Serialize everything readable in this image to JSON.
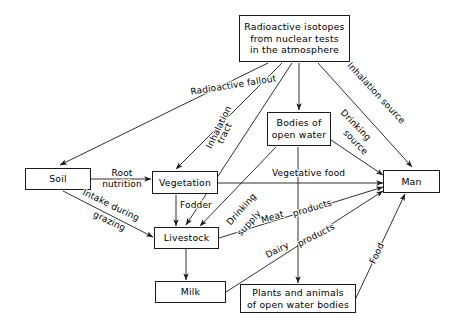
{
  "diagram": {
    "background": "#ffffff",
    "line_color": "#1a1a1a",
    "nodes": [
      {
        "id": "source",
        "label": "Radioactive isotopes\nfrom nuclear tests\nin the atmosphere"
      },
      {
        "id": "water",
        "label": "Bodies  of\nopen water"
      },
      {
        "id": "soil",
        "label": "Soil"
      },
      {
        "id": "vegetation",
        "label": "Vegetation"
      },
      {
        "id": "man",
        "label": "Man"
      },
      {
        "id": "livestock",
        "label": "Livestock"
      },
      {
        "id": "milk",
        "label": "Milk"
      },
      {
        "id": "plants",
        "label": "Plants  and  animals\nof  open  water  bodies"
      }
    ],
    "edge_labels": [
      {
        "id": "fallout",
        "text": "Radioactive  fallout"
      },
      {
        "id": "inhalation-source",
        "text": "Inhalation  source"
      },
      {
        "id": "inhalation-tract",
        "text": "Inhalation"
      },
      {
        "id": "tract",
        "text": "tract"
      },
      {
        "id": "drinking-source",
        "text": "Drinking"
      },
      {
        "id": "drinking-source-2",
        "text": "source"
      },
      {
        "id": "root-nutrition",
        "text": "Root\nnutrition"
      },
      {
        "id": "vegetative-food",
        "text": "Vegetative  food"
      },
      {
        "id": "fodder",
        "text": "Fodder"
      },
      {
        "id": "intake-grazing",
        "text": "Intake  during"
      },
      {
        "id": "intake-grazing-2",
        "text": "grazing"
      },
      {
        "id": "drinking-supply",
        "text": "Drinking"
      },
      {
        "id": "drinking-supply-2",
        "text": "supply"
      },
      {
        "id": "meat-products",
        "text": "Meat"
      },
      {
        "id": "meat-products-2",
        "text": "products"
      },
      {
        "id": "dairy-products",
        "text": "Dairy"
      },
      {
        "id": "dairy-products-2",
        "text": "products"
      },
      {
        "id": "food",
        "text": "Food"
      }
    ]
  }
}
